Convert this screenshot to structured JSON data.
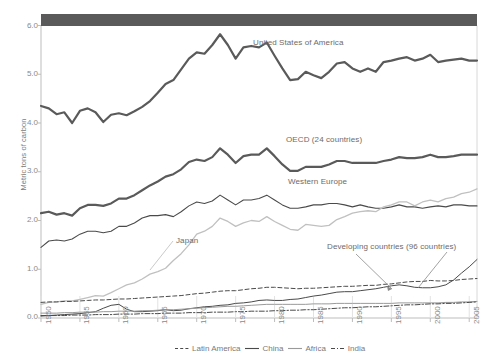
{
  "axes": {
    "ylabel": "Metric tons of carbon",
    "yticks": [
      "0.0",
      "1.0",
      "2.0",
      "3.0",
      "4.0",
      "5.0",
      "6.0"
    ],
    "ylim": [
      0,
      6
    ],
    "xticks": [
      "1950",
      "1955",
      "1960",
      "1965",
      "1970",
      "1975",
      "1980",
      "1985",
      "1990",
      "1995",
      "2000",
      "2005"
    ],
    "xlim": [
      1950,
      2006
    ]
  },
  "annotations": {
    "usa": "United States of America",
    "oecd": "OECD (24 countries)",
    "western_europe": "Western Europe",
    "japan": "Japan",
    "developing": "Developing countries (96 countries)"
  },
  "legend": {
    "items": [
      {
        "label": "Latin America",
        "style": "dashed",
        "color": "#4a4a4a"
      },
      {
        "label": "China",
        "style": "solid",
        "color": "#4a4a4a"
      },
      {
        "label": "Africa",
        "style": "solid",
        "color": "#9a9a9a"
      },
      {
        "label": "India",
        "style": "dash-dot",
        "color": "#4a4a4a"
      }
    ]
  },
  "colors": {
    "header_band": "#5a5a5a",
    "usa_line": "#5a5a5a",
    "oecd_line": "#5a5a5a",
    "western_europe_line": "#4a4a4a",
    "japan_line": "#c0c0c0",
    "axis": "#bdbdbd",
    "text": "#7a7a7a"
  },
  "chart_data": {
    "type": "line",
    "title": "",
    "subtitle": "",
    "xlabel": "",
    "ylabel": "Metric tons of carbon",
    "xlim": [
      1950,
      2006
    ],
    "ylim": [
      0,
      6
    ],
    "grid": false,
    "legend_position": "bottom",
    "x": [
      1950,
      1951,
      1952,
      1953,
      1954,
      1955,
      1956,
      1957,
      1958,
      1959,
      1960,
      1961,
      1962,
      1963,
      1964,
      1965,
      1966,
      1967,
      1968,
      1969,
      1970,
      1971,
      1972,
      1973,
      1974,
      1975,
      1976,
      1977,
      1978,
      1979,
      1980,
      1981,
      1982,
      1983,
      1984,
      1985,
      1986,
      1987,
      1988,
      1989,
      1990,
      1991,
      1992,
      1993,
      1994,
      1995,
      1996,
      1997,
      1998,
      1999,
      2000,
      2001,
      2002,
      2003,
      2004,
      2005,
      2006
    ],
    "series": [
      {
        "name": "United States of America",
        "style": "solid",
        "color": "#5a5a5a",
        "width": 2.2,
        "values": [
          4.35,
          4.3,
          4.18,
          4.22,
          4.0,
          4.25,
          4.3,
          4.22,
          4.02,
          4.17,
          4.2,
          4.16,
          4.24,
          4.33,
          4.45,
          4.62,
          4.8,
          4.88,
          5.1,
          5.32,
          5.45,
          5.42,
          5.6,
          5.82,
          5.6,
          5.32,
          5.55,
          5.58,
          5.55,
          5.65,
          5.38,
          5.12,
          4.88,
          4.9,
          5.05,
          4.98,
          4.92,
          5.05,
          5.22,
          5.25,
          5.12,
          5.05,
          5.12,
          5.05,
          5.25,
          5.28,
          5.32,
          5.35,
          5.28,
          5.32,
          5.4,
          5.25,
          5.28,
          5.3,
          5.32,
          5.28,
          5.28
        ]
      },
      {
        "name": "OECD (24 countries)",
        "style": "solid",
        "color": "#5a5a5a",
        "width": 2.2,
        "values": [
          2.15,
          2.18,
          2.12,
          2.15,
          2.1,
          2.25,
          2.32,
          2.32,
          2.3,
          2.35,
          2.45,
          2.45,
          2.52,
          2.62,
          2.72,
          2.8,
          2.9,
          2.95,
          3.05,
          3.2,
          3.25,
          3.22,
          3.3,
          3.48,
          3.35,
          3.18,
          3.32,
          3.35,
          3.35,
          3.48,
          3.32,
          3.15,
          3.02,
          3.02,
          3.1,
          3.1,
          3.1,
          3.15,
          3.22,
          3.22,
          3.18,
          3.18,
          3.18,
          3.18,
          3.22,
          3.25,
          3.3,
          3.28,
          3.28,
          3.3,
          3.35,
          3.3,
          3.3,
          3.32,
          3.35,
          3.35,
          3.35
        ]
      },
      {
        "name": "Western Europe",
        "style": "solid",
        "color": "#4a4a4a",
        "width": 1.1,
        "values": [
          1.45,
          1.58,
          1.6,
          1.58,
          1.62,
          1.72,
          1.78,
          1.78,
          1.75,
          1.78,
          1.88,
          1.88,
          1.95,
          2.05,
          2.1,
          2.1,
          2.12,
          2.08,
          2.18,
          2.3,
          2.38,
          2.35,
          2.4,
          2.52,
          2.42,
          2.32,
          2.42,
          2.42,
          2.45,
          2.52,
          2.42,
          2.32,
          2.25,
          2.25,
          2.28,
          2.32,
          2.32,
          2.35,
          2.35,
          2.32,
          2.28,
          2.32,
          2.28,
          2.25,
          2.25,
          2.28,
          2.32,
          2.28,
          2.28,
          2.25,
          2.28,
          2.3,
          2.28,
          2.32,
          2.32,
          2.3,
          2.3
        ]
      },
      {
        "name": "Japan",
        "style": "solid",
        "color": "#c0c0c0",
        "width": 1.3,
        "values": [
          0.28,
          0.32,
          0.33,
          0.35,
          0.35,
          0.38,
          0.42,
          0.46,
          0.45,
          0.52,
          0.6,
          0.68,
          0.72,
          0.8,
          0.9,
          0.95,
          1.02,
          1.18,
          1.32,
          1.5,
          1.72,
          1.78,
          1.88,
          2.05,
          1.98,
          1.88,
          1.95,
          2.0,
          1.98,
          2.08,
          1.98,
          1.9,
          1.82,
          1.8,
          1.92,
          1.9,
          1.88,
          1.9,
          2.02,
          2.08,
          2.15,
          2.18,
          2.2,
          2.18,
          2.28,
          2.32,
          2.38,
          2.38,
          2.3,
          2.38,
          2.42,
          2.38,
          2.45,
          2.48,
          2.55,
          2.58,
          2.65
        ]
      },
      {
        "name": "Latin America",
        "style": "dashed",
        "color": "#4a4a4a",
        "width": 1.0,
        "values": [
          0.32,
          0.33,
          0.33,
          0.34,
          0.34,
          0.35,
          0.36,
          0.37,
          0.37,
          0.38,
          0.39,
          0.39,
          0.4,
          0.41,
          0.42,
          0.43,
          0.44,
          0.45,
          0.46,
          0.48,
          0.5,
          0.51,
          0.53,
          0.55,
          0.56,
          0.56,
          0.58,
          0.6,
          0.61,
          0.63,
          0.63,
          0.62,
          0.61,
          0.6,
          0.61,
          0.61,
          0.62,
          0.63,
          0.64,
          0.65,
          0.65,
          0.66,
          0.67,
          0.67,
          0.69,
          0.7,
          0.72,
          0.74,
          0.75,
          0.75,
          0.77,
          0.76,
          0.76,
          0.77,
          0.79,
          0.8,
          0.81
        ]
      },
      {
        "name": "China",
        "style": "solid",
        "color": "#4a4a4a",
        "width": 1.0,
        "values": [
          0.04,
          0.05,
          0.06,
          0.07,
          0.08,
          0.09,
          0.11,
          0.13,
          0.2,
          0.26,
          0.28,
          0.18,
          0.13,
          0.13,
          0.14,
          0.15,
          0.17,
          0.15,
          0.16,
          0.19,
          0.21,
          0.23,
          0.24,
          0.26,
          0.27,
          0.3,
          0.31,
          0.33,
          0.36,
          0.37,
          0.36,
          0.36,
          0.38,
          0.39,
          0.42,
          0.45,
          0.47,
          0.5,
          0.53,
          0.54,
          0.54,
          0.56,
          0.58,
          0.6,
          0.63,
          0.66,
          0.68,
          0.66,
          0.63,
          0.62,
          0.62,
          0.64,
          0.68,
          0.78,
          0.92,
          1.05,
          1.2
        ]
      },
      {
        "name": "Africa",
        "style": "solid",
        "color": "#9a9a9a",
        "width": 1.0,
        "values": [
          0.1,
          0.1,
          0.1,
          0.11,
          0.11,
          0.12,
          0.12,
          0.12,
          0.13,
          0.13,
          0.14,
          0.14,
          0.14,
          0.15,
          0.15,
          0.16,
          0.17,
          0.17,
          0.18,
          0.19,
          0.2,
          0.21,
          0.22,
          0.23,
          0.24,
          0.24,
          0.25,
          0.26,
          0.27,
          0.28,
          0.28,
          0.28,
          0.28,
          0.28,
          0.28,
          0.29,
          0.29,
          0.29,
          0.3,
          0.3,
          0.3,
          0.3,
          0.3,
          0.3,
          0.3,
          0.3,
          0.31,
          0.31,
          0.31,
          0.31,
          0.31,
          0.31,
          0.32,
          0.32,
          0.33,
          0.33,
          0.34
        ]
      },
      {
        "name": "India",
        "style": "dash-dot",
        "color": "#4a4a4a",
        "width": 1.0,
        "values": [
          0.05,
          0.05,
          0.05,
          0.05,
          0.06,
          0.06,
          0.06,
          0.07,
          0.07,
          0.07,
          0.08,
          0.08,
          0.08,
          0.09,
          0.09,
          0.09,
          0.1,
          0.1,
          0.1,
          0.11,
          0.11,
          0.11,
          0.12,
          0.12,
          0.12,
          0.13,
          0.13,
          0.14,
          0.14,
          0.14,
          0.15,
          0.15,
          0.16,
          0.16,
          0.17,
          0.17,
          0.18,
          0.19,
          0.2,
          0.21,
          0.21,
          0.22,
          0.23,
          0.23,
          0.24,
          0.25,
          0.26,
          0.27,
          0.27,
          0.28,
          0.29,
          0.29,
          0.3,
          0.3,
          0.31,
          0.32,
          0.33
        ]
      }
    ]
  }
}
